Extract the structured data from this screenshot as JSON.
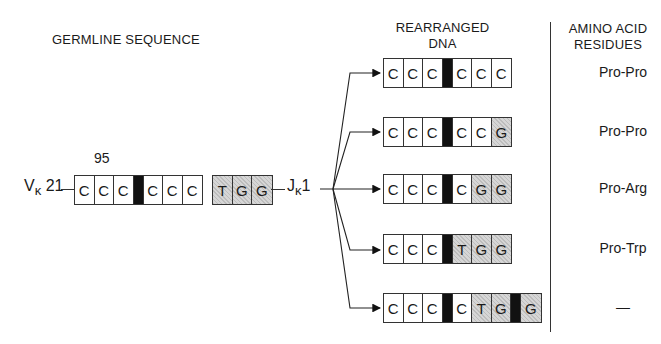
{
  "headers": {
    "germline": "GERMLINE SEQUENCE",
    "rearranged_line1": "REARRANGED",
    "rearranged_line2": "DNA",
    "amino_line1": "AMINO ACID",
    "amino_line2": "RESIDUES"
  },
  "germline": {
    "v_label": "V",
    "v_sub": "κ",
    "v_num": "21",
    "position_label": "95",
    "j_label": "J",
    "j_sub": "κ",
    "j_num": "1",
    "v_segment": [
      "C",
      "C",
      "C",
      "|",
      "C",
      "C",
      "C"
    ],
    "j_segment": [
      "T",
      "G",
      "G"
    ]
  },
  "rearranged": [
    {
      "cells": [
        {
          "t": "C"
        },
        {
          "t": "C"
        },
        {
          "t": "C"
        },
        {
          "t": "",
          "k": "junc"
        },
        {
          "t": "C"
        },
        {
          "t": "C"
        },
        {
          "t": "C"
        }
      ],
      "residues": "Pro-Pro"
    },
    {
      "cells": [
        {
          "t": "C"
        },
        {
          "t": "C"
        },
        {
          "t": "C"
        },
        {
          "t": "",
          "k": "junc"
        },
        {
          "t": "C"
        },
        {
          "t": "C"
        },
        {
          "t": "G",
          "k": "hatch"
        }
      ],
      "residues": "Pro-Pro"
    },
    {
      "cells": [
        {
          "t": "C"
        },
        {
          "t": "C"
        },
        {
          "t": "C"
        },
        {
          "t": "",
          "k": "junc"
        },
        {
          "t": "C"
        },
        {
          "t": "G",
          "k": "hatch"
        },
        {
          "t": "G",
          "k": "hatch"
        }
      ],
      "residues": "Pro-Arg"
    },
    {
      "cells": [
        {
          "t": "C"
        },
        {
          "t": "C"
        },
        {
          "t": "C"
        },
        {
          "t": "",
          "k": "junc"
        },
        {
          "t": "T",
          "k": "hatch"
        },
        {
          "t": "G",
          "k": "hatch"
        },
        {
          "t": "G",
          "k": "hatch"
        }
      ],
      "residues": "Pro-Trp"
    },
    {
      "cells": [
        {
          "t": "C"
        },
        {
          "t": "C"
        },
        {
          "t": "C"
        },
        {
          "t": "",
          "k": "junc"
        },
        {
          "t": "C"
        },
        {
          "t": "T",
          "k": "hatch"
        },
        {
          "t": "G",
          "k": "hatch"
        },
        {
          "t": "",
          "k": "junc"
        },
        {
          "t": "G",
          "k": "hatch"
        }
      ],
      "residues": "—"
    }
  ]
}
